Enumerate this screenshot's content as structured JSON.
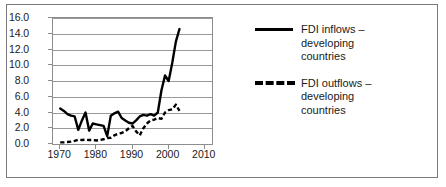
{
  "chart_data": {
    "type": "line",
    "title": "",
    "xlabel": "",
    "ylabel": "",
    "xlim": [
      1968,
      2012
    ],
    "ylim": [
      0.0,
      16.0
    ],
    "ytick_step": 2.0,
    "grid": true,
    "legend_position": "right",
    "y_ticks": [
      "0.0",
      "2.0",
      "4.0",
      "6.0",
      "8.0",
      "10.0",
      "12.0",
      "14.0",
      "16.0"
    ],
    "y_tick_values": [
      0.0,
      2.0,
      4.0,
      6.0,
      8.0,
      10.0,
      12.0,
      14.0,
      16.0
    ],
    "x_ticks": [
      "1970",
      "1980",
      "1990",
      "2000",
      "2010"
    ],
    "x_tick_values": [
      1970,
      1980,
      1990,
      2000,
      2010
    ],
    "x": [
      1970,
      1971,
      1972,
      1973,
      1974,
      1975,
      1976,
      1977,
      1978,
      1979,
      1980,
      1981,
      1982,
      1983,
      1984,
      1985,
      1986,
      1987,
      1988,
      1989,
      1990,
      1991,
      1992,
      1993,
      1994,
      1995,
      1996,
      1997,
      1998,
      1999,
      2000,
      2001,
      2002,
      2003
    ],
    "series": [
      {
        "name": "FDI inflows – developing countries",
        "style": "solid",
        "color": "#000000",
        "values": [
          4.5,
          4.2,
          3.8,
          3.6,
          3.5,
          1.8,
          3.0,
          4.0,
          1.7,
          2.6,
          2.5,
          2.4,
          2.3,
          1.0,
          3.6,
          3.9,
          4.1,
          3.3,
          3.0,
          2.7,
          2.6,
          3.0,
          3.5,
          3.7,
          3.6,
          3.8,
          3.6,
          4.0,
          6.8,
          8.7,
          8.0,
          10.3,
          13.0,
          14.6
        ]
      },
      {
        "name": "FDI outflows – developing countries",
        "style": "dashed",
        "color": "#000000",
        "values": [
          0.2,
          0.2,
          0.25,
          0.3,
          0.4,
          0.55,
          0.5,
          0.55,
          0.5,
          0.5,
          0.45,
          0.5,
          0.6,
          0.75,
          0.8,
          1.1,
          1.3,
          1.4,
          1.6,
          2.0,
          2.3,
          1.6,
          1.1,
          2.0,
          2.6,
          3.0,
          3.1,
          3.3,
          3.2,
          4.0,
          4.3,
          4.4,
          5.0,
          4.2
        ]
      }
    ]
  },
  "legend": {
    "entries": [
      {
        "swatch": "solid-line-swatch",
        "line1": "FDI inflows –",
        "line2": "developing",
        "line3": "countries"
      },
      {
        "swatch": "dashed-line-swatch",
        "line1": "FDI outflows –",
        "line2": "developing",
        "line3": "countries"
      }
    ]
  }
}
